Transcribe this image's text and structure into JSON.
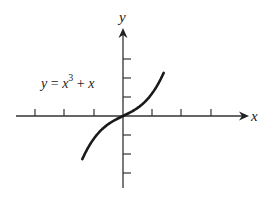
{
  "chart_data": {
    "type": "line",
    "title": "",
    "function": "y = x^3 + x",
    "annotation": {
      "text_y": "y",
      "text_eq": " = ",
      "text_x": "x",
      "text_exp": "3",
      "text_plus": " + ",
      "text_x2": "x"
    },
    "xlabel": "x",
    "ylabel": "y",
    "x_ticks_left": 3,
    "x_ticks_right": 3,
    "y_ticks_up": 3,
    "y_ticks_down": 3,
    "tick_labels": [],
    "grid": false,
    "legend": null,
    "x_range_plotted": [
      -1.1,
      1.1
    ],
    "colors": {
      "curve": "#1a1a1a",
      "axes": "#333333"
    }
  }
}
